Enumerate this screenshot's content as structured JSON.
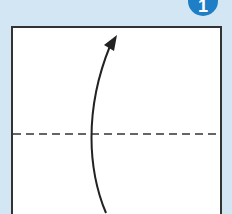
{
  "diagram": {
    "type": "origami-step",
    "step_badge": {
      "label": "1",
      "color": "#1e7ec6"
    },
    "background_color": "#d3e6f3",
    "paper": {
      "fill": "#ffffff",
      "stroke": "#333333"
    },
    "fold_line": {
      "style": "dashed",
      "meaning": "valley-fold"
    },
    "arrow": {
      "direction": "up",
      "meaning": "fold bottom edge up"
    }
  }
}
